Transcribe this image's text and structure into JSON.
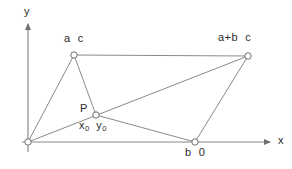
{
  "figure": {
    "background_color": "#ffffff",
    "line_color": "#8a8a8a",
    "axis_color": "#8a8a8a",
    "text_color": "#2b2b2b",
    "vertex_fill": "#ffffff",
    "vertex_stroke": "#6e6e6e"
  },
  "axes": {
    "x_label": "x",
    "y_label": "y",
    "origin": {
      "x": 28,
      "y": 142
    },
    "x_axis": {
      "x1": 28,
      "y1": 142,
      "x2": 272,
      "y2": 142
    },
    "y_axis": {
      "x1": 28,
      "y1": 152,
      "x2": 28,
      "y2": 22
    }
  },
  "points": [
    {
      "name": "origin",
      "label": "",
      "x": 28,
      "y": 142
    },
    {
      "name": "vertex-a-c",
      "label": "a  c",
      "x": 74,
      "y": 55
    },
    {
      "name": "vertex-a-plus-b-c",
      "label": "a+b  c",
      "x": 248,
      "y": 56
    },
    {
      "name": "point-P",
      "label": "P",
      "sublabel_x": "x",
      "sublabel_x_sub": "0",
      "sublabel_y": "y",
      "sublabel_y_sub": "0",
      "x": 96,
      "y": 115
    },
    {
      "name": "vertex-b-0",
      "label": "b  0",
      "x": 195,
      "y": 142
    }
  ],
  "segments": [
    {
      "name": "origin-to-a-c",
      "x1": 28,
      "y1": 142,
      "x2": 74,
      "y2": 55
    },
    {
      "name": "a-c-to-P",
      "x1": 74,
      "y1": 55,
      "x2": 96,
      "y2": 115
    },
    {
      "name": "a-c-to-a-plus-b-c",
      "x1": 74,
      "y1": 55,
      "x2": 248,
      "y2": 56
    },
    {
      "name": "origin-to-a-plus-b-c",
      "x1": 28,
      "y1": 142,
      "x2": 248,
      "y2": 56
    },
    {
      "name": "P-to-b-0",
      "x1": 96,
      "y1": 115,
      "x2": 195,
      "y2": 142
    },
    {
      "name": "b-0-to-a-plus-b-c",
      "x1": 195,
      "y1": 142,
      "x2": 248,
      "y2": 56
    }
  ]
}
